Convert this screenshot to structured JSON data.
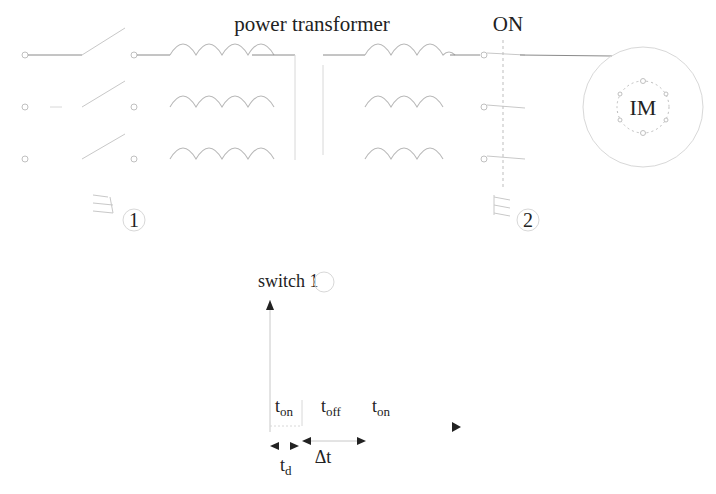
{
  "circuit": {
    "transformer_label": "power transformer",
    "switch2_state_label": "ON",
    "motor_label": "IM",
    "switch1_number": "1",
    "switch2_number": "2"
  },
  "timing": {
    "axis_label": "switch 1",
    "intervals": [
      {
        "base": "t",
        "sub": "on"
      },
      {
        "base": "t",
        "sub": "off"
      },
      {
        "base": "t",
        "sub": "on"
      }
    ],
    "delay": {
      "base": "t",
      "sub": "d"
    },
    "delta": "Δt"
  }
}
